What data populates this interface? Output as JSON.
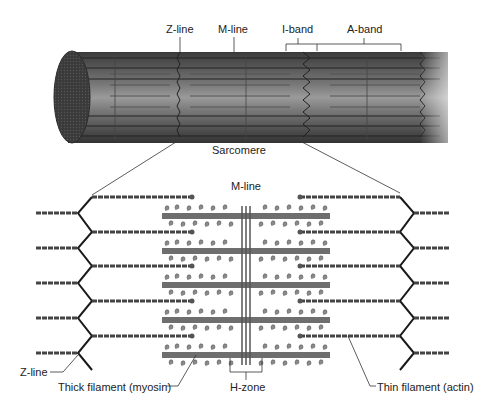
{
  "diagram": {
    "top_labels": {
      "z_line": "Z-line",
      "m_line": "M-line",
      "i_band": "I-band",
      "a_band": "A-band",
      "sarcomere": "Sarcomere"
    },
    "bottom_labels": {
      "m_line": "M-line",
      "z_line": "Z-line",
      "thick_filament": "Thick filament (myosin)",
      "h_zone": "H-zone",
      "thin_filament": "Thin filament (actin)"
    },
    "colors": {
      "fiber_dark": "#3c3c3c",
      "fiber_mid": "#6a6a6a",
      "fiber_light": "#9a9a9a",
      "myosin": "#6e6e6e",
      "myosin_head": "#8a8a8a",
      "actin": "#444444",
      "zline": "#1a1a1a"
    },
    "structure": {
      "thick_filament_rows": 5,
      "thin_filament_rows": 5,
      "m_line_strands": 3
    }
  }
}
